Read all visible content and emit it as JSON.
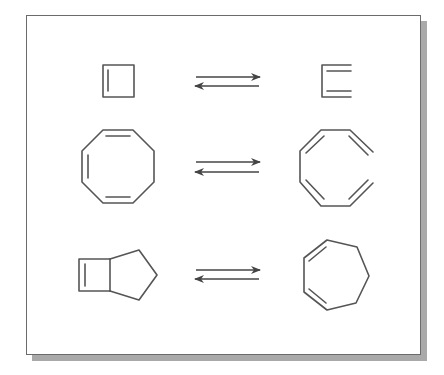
{
  "figure": {
    "description": "Three reversible electrocyclic ring-opening / ring-closing equilibria",
    "colors": {
      "line": "#555555",
      "border": "#6b6b6b",
      "shadow": "#a9a9a9",
      "background": "#ffffff"
    },
    "reactions": [
      {
        "reactant": "cyclobutene",
        "arrow": "equilibrium",
        "product": "1,3-butadiene"
      },
      {
        "reactant": "cyclooctatriene",
        "arrow": "equilibrium",
        "product": "octatetraene (open chain)"
      },
      {
        "reactant": "bicyclo[3.2.0]hept-6-ene",
        "arrow": "equilibrium",
        "product": "1,3-cycloheptadiene"
      }
    ]
  }
}
